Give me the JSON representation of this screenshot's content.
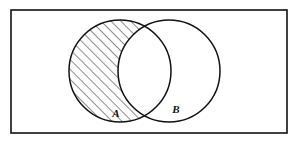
{
  "figure": {
    "name": "venn-diagram",
    "type": "set-diagram",
    "background_color": "#ffffff",
    "stroke_color": "#111111",
    "hatch_color": "#1a1a1a"
  },
  "universe": {
    "shape": "rectangle",
    "x": 11,
    "y": 10,
    "width": 276,
    "height": 123,
    "stroke_width": 1.6
  },
  "sets": [
    {
      "id": "A",
      "label": "A",
      "cx": 120,
      "cy": 71,
      "r": 51,
      "label_x": 116,
      "label_y": 117,
      "shaded": true
    },
    {
      "id": "B",
      "label": "B",
      "cx": 169,
      "cy": 71,
      "r": 51,
      "label_x": 176,
      "label_y": 113,
      "shaded": false
    }
  ],
  "shading": {
    "region": "A-minus-B",
    "pattern": "diagonal-hatch",
    "angle_degrees": 45,
    "spacing_px": 7,
    "line_width": 1
  },
  "intersection_points": [
    {
      "x": 144,
      "y": 33
    },
    {
      "x": 144,
      "y": 110
    }
  ]
}
